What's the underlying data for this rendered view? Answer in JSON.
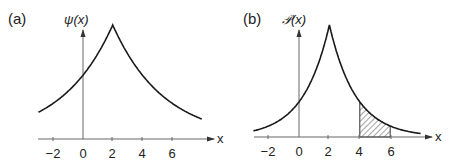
{
  "chart_data": [
    {
      "panel": "(a)",
      "type": "line",
      "title": "",
      "ylabel": "ψ(x)",
      "xlabel": "x",
      "function": "exp(-|x-2|/3.45)",
      "peak_x": 2,
      "xlim": [
        -3,
        8
      ],
      "xticks": [
        -2,
        0,
        2,
        4,
        6
      ],
      "xtick_labels": [
        "−2",
        "0",
        "2",
        "4",
        "6"
      ],
      "grid": false,
      "x": [
        -3,
        -2,
        -1,
        0,
        1,
        2,
        3,
        4,
        5,
        6,
        7,
        8
      ],
      "values": [
        0.235,
        0.31,
        0.42,
        0.56,
        0.75,
        1.0,
        0.75,
        0.56,
        0.42,
        0.31,
        0.235,
        0.175
      ]
    },
    {
      "panel": "(b)",
      "type": "area",
      "title": "",
      "ylabel": "𝒫(x)",
      "xlabel": "x",
      "function": "exp(-2|x-2|/3.45)",
      "peak_x": 2,
      "xlim": [
        -3,
        8
      ],
      "xticks": [
        -2,
        0,
        2,
        4,
        6
      ],
      "xtick_labels": [
        "−2",
        "0",
        "2",
        "4",
        "6"
      ],
      "grid": false,
      "shaded_region": {
        "from": 4,
        "to": 6,
        "style": "hatched"
      },
      "x": [
        -3,
        -2,
        -1,
        0,
        1,
        2,
        3,
        4,
        5,
        6,
        7,
        8
      ],
      "values": [
        0.055,
        0.098,
        0.176,
        0.31,
        0.56,
        1.0,
        0.56,
        0.31,
        0.176,
        0.098,
        0.055,
        0.031
      ]
    }
  ],
  "panels": {
    "a": {
      "label": "(a)",
      "ylabel": "ψ(x)",
      "xlabel": "x",
      "ticks": [
        "−2",
        "0",
        "2",
        "4",
        "6"
      ]
    },
    "b": {
      "label": "(b)",
      "ylabel": "𝒫(x)",
      "xlabel": "x",
      "ticks": [
        "−2",
        "0",
        "2",
        "4",
        "6"
      ]
    }
  },
  "colors": {
    "line": "#1a1a1a",
    "axis": "#555555",
    "hatch": "#333333"
  }
}
